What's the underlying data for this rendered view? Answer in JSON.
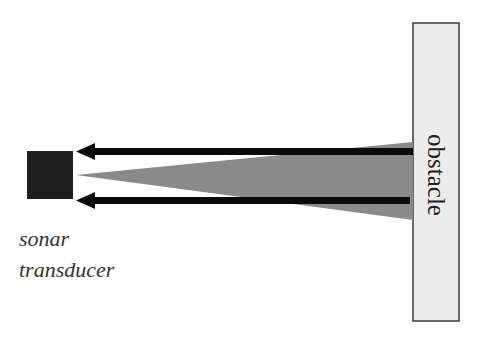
{
  "diagram": {
    "labels": {
      "transducer_line1": "sonar",
      "transducer_line2": "transducer",
      "obstacle": "obstacle"
    },
    "colors": {
      "background": "#ffffff",
      "transducer_fill": "#1e1e1e",
      "cone_fill": "#8a8a8a",
      "arrow": "#0a0a0a",
      "obstacle_fill": "#ececec",
      "obstacle_stroke": "#3a3a3a",
      "text": "#333333"
    },
    "elements": [
      {
        "id": "sonar-transducer",
        "shape": "square",
        "x": 27,
        "y": 151,
        "w": 46,
        "h": 48
      },
      {
        "id": "sonar-beam-cone",
        "shape": "triangle",
        "apex": [
          76,
          175
        ],
        "base_top": [
          413,
          142
        ],
        "base_bottom": [
          413,
          220
        ]
      },
      {
        "id": "echo-arrow-top",
        "shape": "arrow",
        "from": [
          413,
          152
        ],
        "to": [
          76,
          152
        ]
      },
      {
        "id": "echo-arrow-bottom",
        "shape": "arrow",
        "from": [
          410,
          201
        ],
        "to": [
          76,
          201
        ]
      },
      {
        "id": "obstacle",
        "shape": "rectangle",
        "x": 413,
        "y": 23,
        "w": 46,
        "h": 298
      }
    ]
  }
}
